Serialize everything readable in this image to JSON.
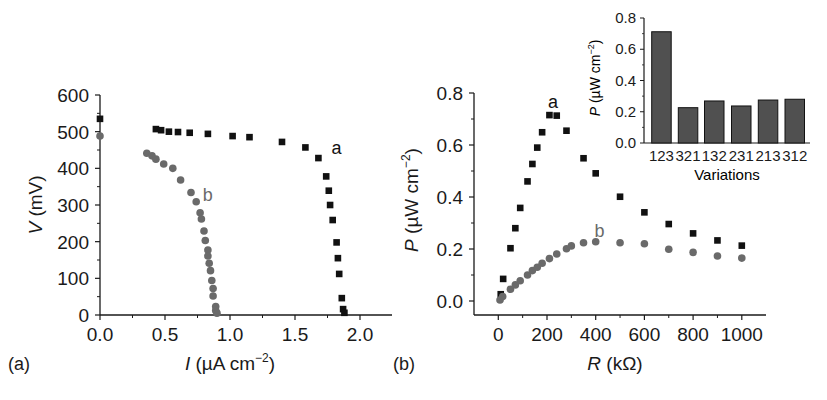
{
  "chart_data": [
    {
      "panel": "(a)",
      "type": "scatter",
      "title": "",
      "xlabel": "I (µA cm⁻²)",
      "xlabel_italic_part": "I",
      "xlabel_rest": " (µA cm",
      "xlabel_sup": "−2",
      "xlabel_close": ")",
      "ylabel": "V (mV)",
      "ylabel_italic_part": "V",
      "ylabel_rest": " (mV)",
      "xlim": [
        0,
        2.25
      ],
      "ylim": [
        0,
        600
      ],
      "xticks": [
        "0.0",
        "0.5",
        "1.0",
        "1.5",
        "2.0"
      ],
      "xtick_values": [
        0,
        0.5,
        1.0,
        1.5,
        2.0
      ],
      "yticks": [
        "0",
        "100",
        "200",
        "300",
        "400",
        "500",
        "600"
      ],
      "ytick_values": [
        0,
        100,
        200,
        300,
        400,
        500,
        600
      ],
      "grid": false,
      "series": [
        {
          "name": "a",
          "marker": "square",
          "color": "#111111",
          "label_pos": [
            1.78,
            455
          ],
          "x": [
            0.0,
            0.43,
            0.47,
            0.53,
            0.6,
            0.69,
            0.83,
            1.02,
            1.15,
            1.4,
            1.58,
            1.68,
            1.74,
            1.76,
            1.77,
            1.79,
            1.82,
            1.83,
            1.84,
            1.86,
            1.87,
            1.88
          ],
          "y": [
            535,
            507,
            504,
            500,
            499,
            497,
            494,
            488,
            485,
            472,
            457,
            428,
            378,
            339,
            300,
            259,
            198,
            155,
            112,
            46,
            16,
            6
          ]
        },
        {
          "name": "b",
          "marker": "circle",
          "color": "#6a6a6a",
          "label_pos": [
            0.79,
            328
          ],
          "x": [
            0.0,
            0.36,
            0.4,
            0.43,
            0.49,
            0.56,
            0.62,
            0.7,
            0.74,
            0.77,
            0.78,
            0.8,
            0.81,
            0.83,
            0.83,
            0.84,
            0.85,
            0.86,
            0.87,
            0.87,
            0.89,
            0.89,
            0.9
          ],
          "y": [
            488,
            441,
            434,
            425,
            412,
            400,
            368,
            334,
            309,
            279,
            262,
            229,
            203,
            177,
            161,
            141,
            121,
            94,
            72,
            52,
            23,
            12,
            5
          ]
        }
      ]
    },
    {
      "panel": "(b)",
      "type": "scatter",
      "title": "",
      "xlabel": "R (kΩ)",
      "xlabel_italic_part": "R",
      "xlabel_rest": " (kΩ)",
      "ylabel": "P (µW cm⁻²)",
      "ylabel_italic_part": "P",
      "ylabel_rest": " (µW cm",
      "ylabel_sup": "−2",
      "ylabel_close": ")",
      "xlim": [
        -100,
        1100
      ],
      "ylim": [
        -0.055,
        0.8
      ],
      "xticks": [
        "0",
        "200",
        "400",
        "600",
        "800",
        "1000"
      ],
      "xtick_values": [
        0,
        200,
        400,
        600,
        800,
        1000
      ],
      "yticks": [
        "0.0",
        "0.2",
        "0.4",
        "0.6",
        "0.8"
      ],
      "ytick_values": [
        0,
        0.2,
        0.4,
        0.6,
        0.8
      ],
      "grid": false,
      "series": [
        {
          "name": "a",
          "marker": "square",
          "color": "#111111",
          "label_pos": [
            225,
            0.765
          ],
          "x": [
            10,
            20,
            50,
            70,
            90,
            120,
            140,
            160,
            180,
            210,
            240,
            280,
            350,
            400,
            500,
            600,
            700,
            800,
            900,
            1000
          ],
          "y": [
            0.026,
            0.085,
            0.203,
            0.28,
            0.358,
            0.46,
            0.527,
            0.59,
            0.649,
            0.715,
            0.713,
            0.655,
            0.549,
            0.491,
            0.401,
            0.341,
            0.296,
            0.26,
            0.233,
            0.213
          ]
        },
        {
          "name": "b",
          "marker": "circle",
          "color": "#6a6a6a",
          "label_pos": [
            395,
            0.27
          ],
          "x": [
            7,
            18,
            50,
            70,
            90,
            120,
            140,
            160,
            180,
            210,
            240,
            280,
            300,
            350,
            400,
            500,
            600,
            700,
            800,
            900,
            1000
          ],
          "y": [
            0.004,
            0.017,
            0.045,
            0.062,
            0.078,
            0.1,
            0.117,
            0.13,
            0.145,
            0.163,
            0.181,
            0.201,
            0.212,
            0.224,
            0.228,
            0.224,
            0.22,
            0.199,
            0.187,
            0.173,
            0.165
          ]
        }
      ]
    },
    {
      "panel": "(b) inset",
      "type": "bar",
      "title": "",
      "xlabel": "Variations",
      "ylabel": "P (µW cm⁻²)",
      "ylabel_italic_part": "P",
      "ylabel_rest": " (µW cm",
      "ylabel_sup": "−2",
      "ylabel_close": ")",
      "ylim": [
        0,
        0.8
      ],
      "yticks": [
        "0.0",
        "0.2",
        "0.4",
        "0.6",
        "0.8"
      ],
      "ytick_values": [
        0,
        0.2,
        0.4,
        0.6,
        0.8
      ],
      "categories": [
        "123",
        "321",
        "132",
        "231",
        "213",
        "312"
      ],
      "values": [
        0.712,
        0.226,
        0.269,
        0.237,
        0.275,
        0.28
      ],
      "bar_color": "#505050",
      "grid": false
    }
  ],
  "figure": {
    "panel_labels": [
      "(a)",
      "(b)"
    ],
    "colors": {
      "axis": "#1a1a1a",
      "series_a": "#111111",
      "series_b": "#6a6a6a",
      "bar": "#505050"
    }
  }
}
